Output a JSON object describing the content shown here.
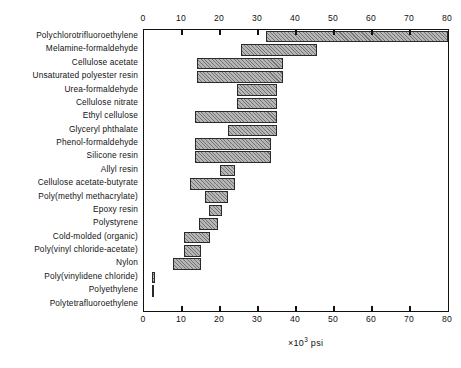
{
  "chart_data": {
    "type": "bar",
    "bar_subtype": "horizontal-floating-range",
    "title": "",
    "subtitle": "",
    "xlabel": "×10³ psi",
    "xlabel_prefix": "×10",
    "xlabel_exponent": "3",
    "xlabel_suffix": "psi",
    "ylabel": "",
    "xlim": [
      0,
      80
    ],
    "xticks": [
      0,
      10,
      20,
      30,
      40,
      50,
      60,
      70,
      80
    ],
    "xticklabels": [
      "0",
      "10",
      "20",
      "30",
      "40",
      "50",
      "60",
      "70",
      "80"
    ],
    "grid": false,
    "legend": "none",
    "axis_ticks_position": "both-top-and-bottom",
    "categories": [
      "Polychlorotrifluoroethylene",
      "Melamine-formaldehyde",
      "Cellulose acetate",
      "Unsaturated polyester resin",
      "Urea-formaldehyde",
      "Cellulose nitrate",
      "Ethyl cellulose",
      "Glyceryl phthalate",
      "Phenol-formaldehyde",
      "Silicone resin",
      "Allyl resin",
      "Cellulose acetate-butyrate",
      "Poly(methyl methacrylate)",
      "Epoxy resin",
      "Polystyrene",
      "Cold-molded (organic)",
      "Poly(vinyl chloride-acetate)",
      "Nylon",
      "Poly(vinylidene chloride)",
      "Polyethylene",
      "Polytetrafluoroethylene"
    ],
    "series": [
      {
        "name": "Tensile strength range",
        "units": "×10³ psi",
        "ranges": [
          {
            "category": "Polychlorotrifluoroethylene",
            "low": 32.0,
            "high": 80.0
          },
          {
            "category": "Melamine-formaldehyde",
            "low": 25.5,
            "high": 45.5
          },
          {
            "category": "Cellulose acetate",
            "low": 14.0,
            "high": 36.5
          },
          {
            "category": "Unsaturated polyester resin",
            "low": 14.0,
            "high": 36.5
          },
          {
            "category": "Urea-formaldehyde",
            "low": 24.5,
            "high": 35.0
          },
          {
            "category": "Cellulose nitrate",
            "low": 24.5,
            "high": 35.0
          },
          {
            "category": "Ethyl cellulose",
            "low": 13.5,
            "high": 35.0
          },
          {
            "category": "Glyceryl phthalate",
            "low": 22.0,
            "high": 35.0
          },
          {
            "category": "Phenol-formaldehyde",
            "low": 13.5,
            "high": 33.5
          },
          {
            "category": "Silicone resin",
            "low": 13.5,
            "high": 33.5
          },
          {
            "category": "Allyl resin",
            "low": 20.0,
            "high": 24.0
          },
          {
            "category": "Cellulose acetate-butyrate",
            "low": 12.0,
            "high": 24.0
          },
          {
            "category": "Poly(methyl methacrylate)",
            "low": 16.0,
            "high": 22.0
          },
          {
            "category": "Epoxy resin",
            "low": 17.0,
            "high": 20.5
          },
          {
            "category": "Polystyrene",
            "low": 14.5,
            "high": 19.5
          },
          {
            "category": "Cold-molded (organic)",
            "low": 10.5,
            "high": 17.5
          },
          {
            "category": "Poly(vinyl chloride-acetate)",
            "low": 10.5,
            "high": 15.0
          },
          {
            "category": "Nylon",
            "low": 7.5,
            "high": 15.0
          },
          {
            "category": "Poly(vinylidene chloride)",
            "low": 2.0,
            "high": 3.0
          },
          {
            "category": "Polyethylene",
            "low": 2.0,
            "high": 2.4
          },
          {
            "category": "Polytetrafluoroethylene",
            "low": 0.0,
            "high": 0.0
          }
        ]
      }
    ]
  }
}
